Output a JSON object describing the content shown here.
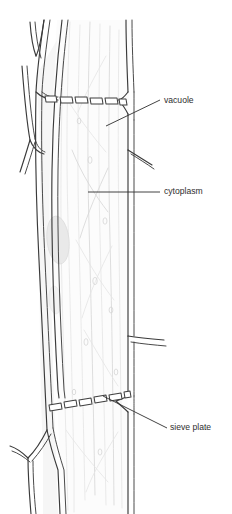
{
  "figure": {
    "width": 232,
    "height": 514,
    "background_color": "#ffffff"
  },
  "labels": [
    {
      "id": "vacuole",
      "text": "vacuole",
      "text_x": 164,
      "text_y": 101,
      "leader": "M 106 126 L 160 100"
    },
    {
      "id": "cytoplasm",
      "text": "cytoplasm",
      "text_x": 164,
      "text_y": 192,
      "leader": "M 88 192 L 160 192"
    },
    {
      "id": "sieve-plate",
      "text": "sieve plate",
      "text_x": 170,
      "text_y": 428,
      "leader": "M 103 396 L 167 428"
    }
  ],
  "colors": {
    "wall_stroke": "#3a3a3a",
    "cytoplasm_stroke": "#d8d8d8",
    "label_text": "#2e2e2e",
    "nucleus_fill": "#e9e9e9",
    "lumen_fill": "#fcfcfc",
    "background": "#ffffff"
  },
  "structures": {
    "left_wall_name": "left cell wall",
    "right_wall_name": "right cell wall",
    "upper_sieve_plate_name": "upper sieve plate",
    "lower_sieve_plate_name": "lower sieve plate",
    "nucleus_name": "nucleus blob",
    "upper_plate_segment_count": 7,
    "lower_plate_segment_count": 7
  },
  "icons": {
    "vacuole_leader": "leader-line-icon",
    "cytoplasm_leader": "leader-line-icon",
    "sieve_plate_leader": "leader-line-icon"
  }
}
